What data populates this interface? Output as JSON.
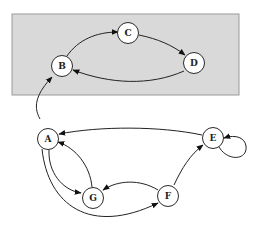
{
  "diagram": {
    "type": "directed-graph",
    "cluster": {
      "x": 12,
      "y": 14,
      "width": 227,
      "height": 81,
      "fill": "#d9d9d9",
      "stroke": "#9a9a9a"
    },
    "nodes": [
      {
        "id": "A",
        "label": "A",
        "x": 48,
        "y": 139
      },
      {
        "id": "B",
        "label": "B",
        "x": 62,
        "y": 66
      },
      {
        "id": "C",
        "label": "C",
        "x": 128,
        "y": 33
      },
      {
        "id": "D",
        "label": "D",
        "x": 194,
        "y": 63
      },
      {
        "id": "E",
        "label": "E",
        "x": 213,
        "y": 138
      },
      {
        "id": "F",
        "label": "F",
        "x": 168,
        "y": 196
      },
      {
        "id": "G",
        "label": "G",
        "x": 93,
        "y": 198
      }
    ],
    "edges": [
      {
        "from": "A",
        "to": "B"
      },
      {
        "from": "B",
        "to": "C"
      },
      {
        "from": "C",
        "to": "D"
      },
      {
        "from": "D",
        "to": "B"
      },
      {
        "from": "E",
        "to": "A"
      },
      {
        "from": "E",
        "to": "E"
      },
      {
        "from": "A",
        "to": "G"
      },
      {
        "from": "G",
        "to": "A"
      },
      {
        "from": "A",
        "to": "F"
      },
      {
        "from": "F",
        "to": "G"
      },
      {
        "from": "F",
        "to": "E"
      }
    ]
  }
}
